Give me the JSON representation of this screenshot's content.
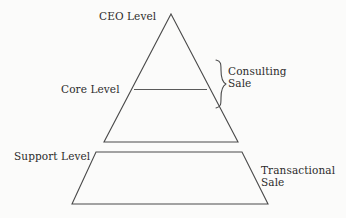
{
  "diagram": {
    "type": "pyramid-hierarchy",
    "title": "",
    "background_color": "#fbfbfa",
    "stroke_color": "#4a4a4a",
    "text_color": "#2b2b2b",
    "levels": [
      {
        "id": "ceo",
        "label": "CEO Level",
        "shape": "triangle-apex"
      },
      {
        "id": "core",
        "label": "Core Level",
        "shape": "triangle-divider"
      },
      {
        "id": "support",
        "label": "Support Level",
        "shape": "trapezoid-base"
      }
    ],
    "annotations": [
      {
        "id": "consulting",
        "label": "Consulting Sale",
        "line1": "Consulting",
        "line2": "Sale",
        "marker": "curly-brace"
      },
      {
        "id": "transactional",
        "label": "Transactional Sale",
        "line1": "Transactional",
        "line2": "Sale",
        "marker": "none"
      }
    ]
  },
  "labels": {
    "ceo": "CEO Level",
    "core": "Core Level",
    "support": "Support Level",
    "consulting_line1": "Consulting",
    "consulting_line2": "Sale",
    "transactional_line1": "Transactional",
    "transactional_line2": "Sale"
  }
}
